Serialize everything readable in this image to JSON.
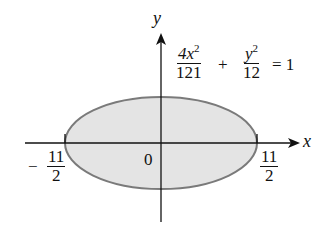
{
  "diagram": {
    "type": "ellipse-region",
    "equation": {
      "term1_num": "4x",
      "term1_exp": "2",
      "term1_den": "121",
      "plus": "+",
      "term2_num": "y",
      "term2_exp": "2",
      "term2_den": "12",
      "equals": "= 1"
    },
    "axes": {
      "x_label": "x",
      "y_label": "y",
      "origin_label": "0"
    },
    "ticks": {
      "left": {
        "sign": "−",
        "num": "11",
        "den": "2"
      },
      "right": {
        "num": "11",
        "den": "2"
      }
    },
    "colors": {
      "fill": "#e4e4e4",
      "outline": "#7a7a7a",
      "axis": "#111111"
    }
  }
}
